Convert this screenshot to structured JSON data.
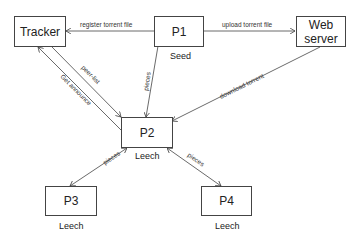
{
  "diagram": {
    "type": "bittorrent-architecture",
    "nodes": [
      {
        "id": "tracker",
        "label": "Tracker",
        "role": ""
      },
      {
        "id": "p1",
        "label": "P1",
        "role": "Seed"
      },
      {
        "id": "webserver",
        "label": "Web server",
        "label_line1": "Web",
        "label_line2": "server",
        "role": ""
      },
      {
        "id": "p2",
        "label": "P2",
        "role": "Leech"
      },
      {
        "id": "p3",
        "label": "P3",
        "role": "Leech"
      },
      {
        "id": "p4",
        "label": "P4",
        "role": "Leech"
      }
    ],
    "edges": [
      {
        "from": "p1",
        "to": "tracker",
        "label": "register torrent file"
      },
      {
        "from": "p1",
        "to": "webserver",
        "label": "upload torrent file"
      },
      {
        "from": "tracker",
        "to": "p2",
        "label": "peer-list"
      },
      {
        "from": "p2",
        "to": "tracker",
        "label": "Get announce"
      },
      {
        "from": "p1",
        "to": "p2",
        "label": "pieces"
      },
      {
        "from": "webserver",
        "to": "p2",
        "label": "download torrent"
      },
      {
        "from": "p2",
        "to": "p3",
        "label": "pieces",
        "bidirectional": true
      },
      {
        "from": "p2",
        "to": "p4",
        "label": "pieces",
        "bidirectional": true
      }
    ]
  },
  "colors": {
    "line": "#444444",
    "text": "#222222",
    "background": "#ffffff"
  }
}
